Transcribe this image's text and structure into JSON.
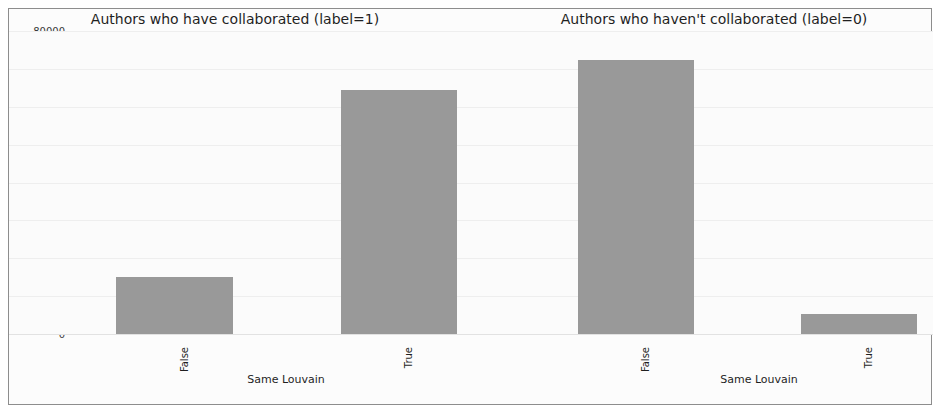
{
  "figure": {
    "border_color": "#8d8d8d",
    "background_color": "#fbfbfb",
    "bar_color": "#999999"
  },
  "chart_data": [
    {
      "type": "bar",
      "title": "Authors who have collaborated (label=1)",
      "xlabel": "Same Louvain",
      "ylabel": "",
      "categories": [
        "False",
        "True"
      ],
      "values": [
        15000,
        64400
      ],
      "ylim": [
        0,
        80000
      ],
      "yticks": [
        0,
        10000,
        20000,
        30000,
        40000,
        50000,
        60000,
        70000,
        80000
      ],
      "ytick_labels": [
        "0",
        "10000",
        "20000",
        "30000",
        "40000",
        "50000",
        "60000",
        "70000",
        "80000"
      ],
      "grid": true,
      "legend": "none",
      "bar_color": "#999999"
    },
    {
      "type": "bar",
      "title": "Authors who haven't collaborated (label=0)",
      "xlabel": "Same Louvain",
      "ylabel": "",
      "categories": [
        "False",
        "True"
      ],
      "values": [
        72300,
        5300
      ],
      "ylim": [
        0,
        80000
      ],
      "yticks": [
        0,
        10000,
        20000,
        30000,
        40000,
        50000,
        60000,
        70000,
        80000
      ],
      "ytick_labels": [
        "0",
        "10000",
        "20000",
        "30000",
        "40000",
        "50000",
        "60000",
        "70000",
        "80000"
      ],
      "grid": true,
      "legend": "none",
      "bar_color": "#999999"
    }
  ]
}
